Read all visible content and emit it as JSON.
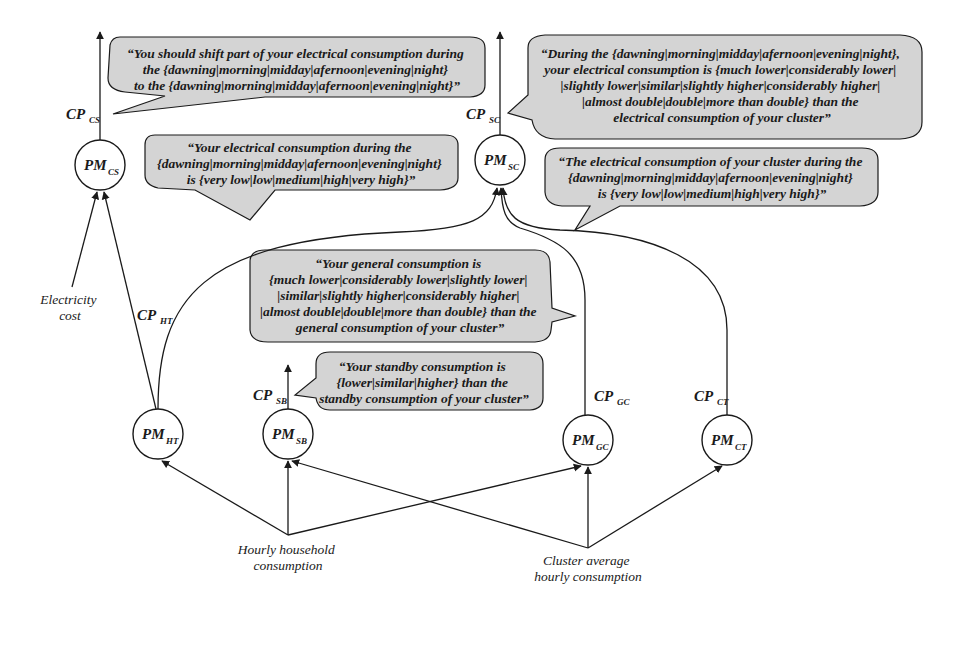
{
  "diagram": {
    "nodes": [
      {
        "id": "PM_CS",
        "main": "PM",
        "sub": "CS"
      },
      {
        "id": "PM_SC",
        "main": "PM",
        "sub": "SC"
      },
      {
        "id": "PM_HT",
        "main": "PM",
        "sub": "HT"
      },
      {
        "id": "PM_SB",
        "main": "PM",
        "sub": "SB"
      },
      {
        "id": "PM_GC",
        "main": "PM",
        "sub": "GC"
      },
      {
        "id": "PM_CT",
        "main": "PM",
        "sub": "CT"
      }
    ],
    "edge_labels": [
      {
        "id": "CP_CS",
        "main": "CP",
        "sub": "CS"
      },
      {
        "id": "CP_SC",
        "main": "CP",
        "sub": "SC"
      },
      {
        "id": "CP_HT",
        "main": "CP",
        "sub": "HT"
      },
      {
        "id": "CP_SB",
        "main": "CP",
        "sub": "SB"
      },
      {
        "id": "CP_GC",
        "main": "CP",
        "sub": "GC"
      },
      {
        "id": "CP_CT",
        "main": "CP",
        "sub": "CT"
      }
    ],
    "inputs": {
      "electricity_cost": [
        "Electricity",
        "cost"
      ],
      "hourly_household": [
        "Hourly household",
        "consumption"
      ],
      "cluster_average": [
        "Cluster average",
        "hourly consumption"
      ]
    },
    "callouts": {
      "shift": [
        "“You should shift part of your electrical consumption during",
        "the {dawning|morning|midday|afernoon|evening|night}",
        "to the {dawning|morning|midday|afernoon|evening|night}”"
      ],
      "own_level": [
        "“Your electrical consumption during the",
        "{dawning|morning|midday|afernoon|evening|night}",
        "is {very low|low|medium|high|very high}”"
      ],
      "compare_cluster": [
        "“During the {dawning|morning|midday|afernoon|evening|night},",
        "your electrical consumption is {much lower|considerably lower|",
        "|slightly lower|similar|slightly higher|considerably higher|",
        "|almost double|double|more than double} than the",
        "electrical consumption of your cluster”"
      ],
      "cluster_level": [
        "“The electrical consumption of your cluster during the",
        "{dawning|morning|midday|afernoon|evening|night}",
        "is {very low|low|medium|high|very high}”"
      ],
      "general": [
        "“Your general consumption is",
        "{much lower|considerably lower|slightly lower|",
        "|similar|slightly higher|considerably higher|",
        "|almost double|double|more than double} than the",
        "general consumption of your cluster”"
      ],
      "standby": [
        "“Your standby consumption is",
        "{lower|similar|higher} than the",
        "standby consumption of your cluster”"
      ]
    },
    "colors": {
      "callout_fill": "#d4d4d4",
      "stroke": "#1a1a1a",
      "background": "#ffffff"
    }
  }
}
